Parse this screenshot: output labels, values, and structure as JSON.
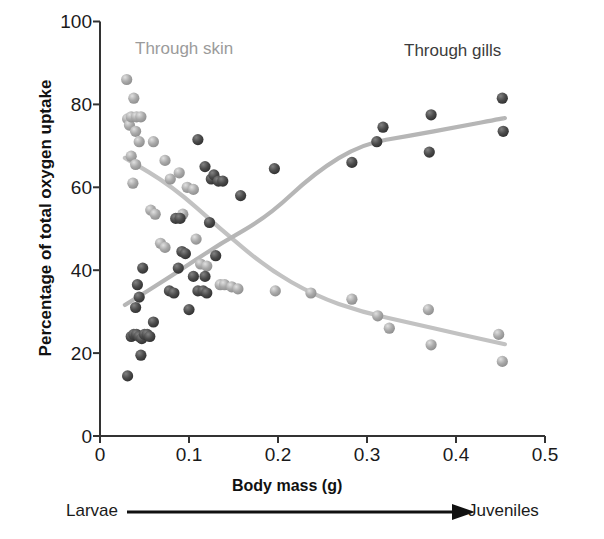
{
  "chart_data": {
    "type": "scatter",
    "title": "",
    "xlabel": "Body mass (g)",
    "ylabel": "Percentage of total oxygen uptake",
    "xlim": [
      0,
      0.5
    ],
    "ylim": [
      0,
      100
    ],
    "xticks": [
      "0",
      "0.1",
      "0.2",
      "0.3",
      "0.4",
      "0.5"
    ],
    "xtick_values": [
      0,
      0.1,
      0.2,
      0.3,
      0.4,
      0.5
    ],
    "yticks": [
      "0",
      "20",
      "40",
      "60",
      "80",
      "100"
    ],
    "ytick_values": [
      0,
      20,
      40,
      60,
      80,
      100
    ],
    "grid": false,
    "legend_position": "in-plot-annotations",
    "annotations": [
      {
        "text": "Through skin",
        "x": 0.085,
        "y": 92,
        "color": "#9b9b9b"
      },
      {
        "text": "Through gills",
        "x": 0.355,
        "y": 91,
        "color": "#3c3c3c"
      }
    ],
    "axis_arrow_label_left": "Larvae",
    "axis_arrow_label_right": "Juveniles",
    "series": [
      {
        "name": "Through skin",
        "color": "#a9a9a9",
        "marker": "circle",
        "points": [
          [
            0.03,
            86.0
          ],
          [
            0.038,
            81.5
          ],
          [
            0.031,
            76.5
          ],
          [
            0.033,
            75.0
          ],
          [
            0.035,
            77.0
          ],
          [
            0.041,
            77.0
          ],
          [
            0.046,
            77.0
          ],
          [
            0.04,
            73.5
          ],
          [
            0.044,
            71.0
          ],
          [
            0.035,
            67.5
          ],
          [
            0.04,
            65.5
          ],
          [
            0.037,
            61.0
          ],
          [
            0.06,
            71.0
          ],
          [
            0.073,
            66.5
          ],
          [
            0.089,
            63.5
          ],
          [
            0.079,
            62.0
          ],
          [
            0.098,
            60.0
          ],
          [
            0.105,
            59.5
          ],
          [
            0.057,
            54.5
          ],
          [
            0.062,
            53.5
          ],
          [
            0.093,
            53.5
          ],
          [
            0.068,
            46.5
          ],
          [
            0.073,
            45.5
          ],
          [
            0.108,
            47.5
          ],
          [
            0.113,
            41.5
          ],
          [
            0.12,
            41.0
          ],
          [
            0.135,
            36.5
          ],
          [
            0.14,
            36.5
          ],
          [
            0.148,
            36.0
          ],
          [
            0.155,
            35.5
          ],
          [
            0.197,
            35.0
          ],
          [
            0.237,
            34.5
          ],
          [
            0.283,
            33.0
          ],
          [
            0.312,
            29.0
          ],
          [
            0.325,
            26.0
          ],
          [
            0.369,
            30.5
          ],
          [
            0.372,
            22.0
          ],
          [
            0.448,
            24.5
          ],
          [
            0.452,
            18.0
          ]
        ],
        "trend": "decreasing"
      },
      {
        "name": "Through gills",
        "color": "#4b4b4b",
        "marker": "circle",
        "points": [
          [
            0.031,
            14.5
          ],
          [
            0.035,
            24.0
          ],
          [
            0.038,
            24.5
          ],
          [
            0.041,
            24.5
          ],
          [
            0.044,
            24.0
          ],
          [
            0.047,
            23.5
          ],
          [
            0.05,
            24.5
          ],
          [
            0.053,
            24.5
          ],
          [
            0.056,
            24.0
          ],
          [
            0.046,
            19.5
          ],
          [
            0.04,
            31.0
          ],
          [
            0.044,
            33.5
          ],
          [
            0.042,
            36.5
          ],
          [
            0.048,
            40.5
          ],
          [
            0.06,
            27.5
          ],
          [
            0.078,
            35.0
          ],
          [
            0.083,
            34.5
          ],
          [
            0.088,
            40.5
          ],
          [
            0.092,
            44.5
          ],
          [
            0.096,
            44.0
          ],
          [
            0.1,
            30.5
          ],
          [
            0.085,
            52.5
          ],
          [
            0.09,
            52.5
          ],
          [
            0.105,
            38.5
          ],
          [
            0.11,
            35.0
          ],
          [
            0.116,
            35.0
          ],
          [
            0.12,
            34.5
          ],
          [
            0.118,
            38.5
          ],
          [
            0.125,
            62.0
          ],
          [
            0.128,
            63.0
          ],
          [
            0.118,
            65.0
          ],
          [
            0.133,
            61.5
          ],
          [
            0.138,
            61.5
          ],
          [
            0.11,
            71.5
          ],
          [
            0.123,
            51.5
          ],
          [
            0.13,
            43.5
          ],
          [
            0.158,
            58.0
          ],
          [
            0.196,
            64.5
          ],
          [
            0.283,
            66.0
          ],
          [
            0.311,
            71.0
          ],
          [
            0.318,
            74.5
          ],
          [
            0.37,
            68.5
          ],
          [
            0.372,
            77.5
          ],
          [
            0.452,
            81.5
          ],
          [
            0.453,
            73.5
          ]
        ],
        "trend": "increasing"
      }
    ],
    "curves": [
      {
        "name": "Through skin fit",
        "color": "#bdbdbd",
        "path": "M 128 132 C 160 185 195 255 228 295 C 265 335 330 347 375 352 C 420 358 470 378 508 398"
      },
      {
        "name": "Through gills fit",
        "color": "#b4b4b4",
        "path": "M 128 345 C 150 300 180 250 215 228 C 260 202 330 185 395 175 C 440 168 480 145 505 118"
      }
    ]
  },
  "axis": {
    "y_tick_labels": [
      "100",
      "80",
      "60",
      "40",
      "20",
      "0"
    ],
    "x_tick_labels": [
      "0",
      "0.1",
      "0.2",
      "0.3",
      "0.4",
      "0.5"
    ]
  }
}
